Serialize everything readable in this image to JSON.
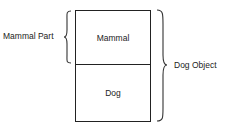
{
  "diagram": {
    "boxes": [
      {
        "label": "Mammal"
      },
      {
        "label": "Dog"
      }
    ],
    "left_brace_label": "Mammal Part",
    "right_brace_label": "Dog Object"
  }
}
